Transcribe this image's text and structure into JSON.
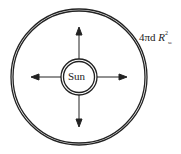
{
  "diagram": {
    "center_label": "Sun",
    "area_label": {
      "prefix": "4πd ",
      "variable": "R",
      "superscript": "2",
      "subscript": "se"
    },
    "arrows": [
      "up",
      "down",
      "left",
      "right"
    ],
    "colors": {
      "stroke": "#222222",
      "background": "#ffffff"
    }
  }
}
